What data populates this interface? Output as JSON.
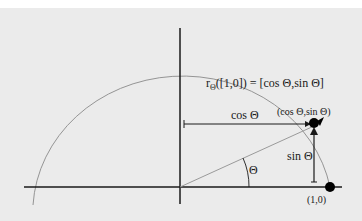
{
  "diagram": {
    "title_formula": {
      "prefix": "r",
      "subscript": "Θ",
      "rest": "([1,0]) = [cos Θ,sin Θ]"
    },
    "labels": {
      "cos": "cos Θ",
      "sin": "sin Θ",
      "theta": "Θ",
      "rotated_point": "(cos Θ,sin Θ)",
      "unit_point": "(1,0)"
    },
    "colors": {
      "background": "#ebebeb",
      "axis": "#1a1a1a",
      "arc": "#8a8a8a",
      "ray": "#9a9a9a",
      "point": "#000000"
    }
  }
}
